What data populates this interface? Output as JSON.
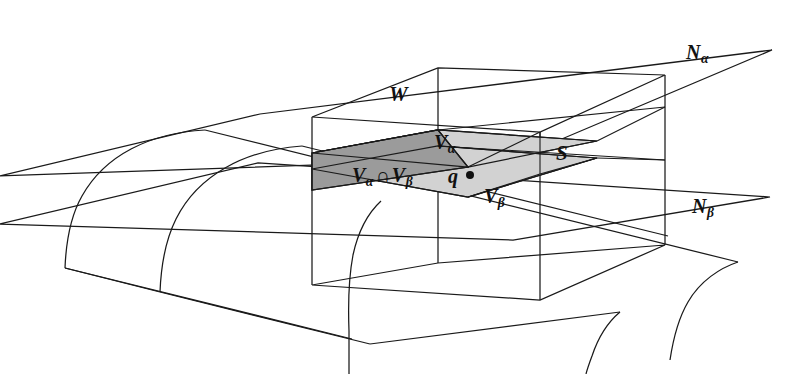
{
  "figure": {
    "background_color": "#ffffff",
    "line_color": "#1a1a1a",
    "shade_light_color": "#d0d0d0",
    "shade_dark_color": "#9a9a9a"
  },
  "labels": {
    "box": "W",
    "surface": "S",
    "neighborhood_alpha": "N",
    "neighborhood_alpha_sub": "α",
    "neighborhood_beta": "N",
    "neighborhood_beta_sub": "β",
    "patch_alpha": "V",
    "patch_alpha_sub": "α",
    "patch_beta": "V",
    "patch_beta_sub": "β",
    "intersection_v_first": "V",
    "intersection_sub_first": "α",
    "intersection_operator": "∩",
    "intersection_v_second": "V",
    "intersection_sub_second": "β",
    "point": "q"
  },
  "markers": {
    "point_q_dot": "filled-dot"
  }
}
